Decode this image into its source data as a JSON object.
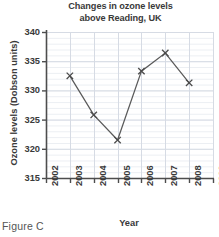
{
  "caption": "Figure C",
  "chart_data": {
    "type": "line",
    "title": "Changes in ozone levels above Reading, UK",
    "title_lines": [
      "Changes in ozone levels",
      "above Reading, UK"
    ],
    "xlabel": "Year",
    "ylabel": "Ozone levels (Dobson units)",
    "x": [
      2003,
      2004,
      2005,
      2006,
      2007,
      2008
    ],
    "values": [
      332.5,
      325.8,
      321.5,
      333.3,
      336.4,
      331.3
    ],
    "xlim": [
      2002,
      2009
    ],
    "ylim": [
      315,
      340
    ],
    "xticks": [
      2002,
      2003,
      2004,
      2005,
      2006,
      2007,
      2008,
      2009
    ],
    "xticklabels": [
      "2002",
      "2003",
      "2004",
      "2005",
      "2006",
      "2007",
      "2008",
      "2009"
    ],
    "yticks": [
      315,
      320,
      325,
      330,
      335,
      340
    ],
    "yticklabels": [
      "315",
      "320",
      "325",
      "330",
      "335",
      "340"
    ],
    "grid": true,
    "grid_minor_y_step": 1,
    "legend": null,
    "marker": "x",
    "line_color": "#5a5a5a",
    "marker_color": "#4a4a4a",
    "grid_color": "#d6dbe4",
    "minor_grid_color": "#eceff3",
    "axis_color": "#4d4d4d"
  }
}
